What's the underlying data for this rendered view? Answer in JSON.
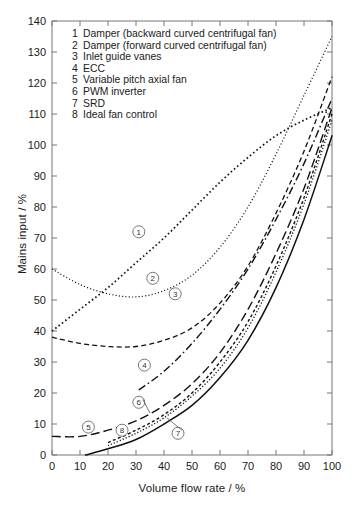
{
  "chart_data": {
    "type": "line",
    "title": "",
    "xlabel": "Volume flow rate / %",
    "ylabel": "Mains input / %",
    "xlim": [
      0,
      100
    ],
    "ylim": [
      0,
      140
    ],
    "xticks": [
      0,
      10,
      20,
      30,
      40,
      50,
      60,
      70,
      80,
      90,
      100
    ],
    "yticks": [
      0,
      10,
      20,
      30,
      40,
      50,
      60,
      70,
      80,
      90,
      100,
      110,
      120,
      130,
      140
    ],
    "grid": false,
    "legend_position": "upper-left-inside",
    "series": [
      {
        "id": "1",
        "name": "Damper (backward curved centrifugal fan)",
        "style": "dotted",
        "label_point": [
          31,
          72
        ],
        "x": [
          0,
          10,
          20,
          30,
          40,
          50,
          60,
          70,
          80,
          90,
          100
        ],
        "y": [
          40,
          47,
          54,
          62,
          70,
          79,
          88,
          96,
          103,
          108,
          112
        ]
      },
      {
        "id": "2",
        "name": "Damper (forward curved centrifugal fan)",
        "style": "fine-dotted",
        "label_point": [
          36,
          57
        ],
        "x": [
          0,
          10,
          20,
          30,
          40,
          50,
          60,
          70,
          80,
          90,
          100
        ],
        "y": [
          60,
          55,
          52,
          51,
          53,
          58,
          67,
          80,
          97,
          116,
          135
        ]
      },
      {
        "id": "3",
        "name": "Inlet guide vanes",
        "style": "dashed",
        "label_point": [
          44,
          52
        ],
        "x": [
          0,
          10,
          20,
          30,
          40,
          50,
          60,
          70,
          80,
          90,
          100
        ],
        "y": [
          38,
          36,
          35,
          35,
          37,
          41,
          49,
          61,
          78,
          98,
          122
        ]
      },
      {
        "id": "4",
        "name": "ECC",
        "style": "dash-dot",
        "label_point": [
          33,
          29
        ],
        "x": [
          31,
          40,
          50,
          60,
          70,
          80,
          90,
          100
        ],
        "y": [
          21,
          27,
          36,
          47,
          60,
          76,
          94,
          115
        ]
      },
      {
        "id": "5",
        "name": "Variable pitch axial fan",
        "style": "long-dashed",
        "label_point": [
          13,
          9
        ],
        "x": [
          0,
          10,
          20,
          30,
          40,
          50,
          60,
          70,
          80,
          90,
          100
        ],
        "y": [
          6,
          6,
          8,
          11,
          16,
          23,
          33,
          47,
          65,
          86,
          112
        ]
      },
      {
        "id": "6",
        "name": "PWM inverter",
        "style": "short-dashed",
        "label_point": [
          31,
          17
        ],
        "x": [
          20,
          30,
          40,
          50,
          60,
          70,
          80,
          90,
          100
        ],
        "y": [
          4,
          8,
          13,
          20,
          30,
          43,
          61,
          83,
          110
        ]
      },
      {
        "id": "7",
        "name": "SRD",
        "style": "dotted-fine",
        "label_point": [
          45,
          7
        ],
        "x": [
          20,
          30,
          40,
          50,
          60,
          70,
          80,
          90,
          100
        ],
        "y": [
          3,
          7,
          12,
          19,
          28,
          41,
          59,
          81,
          108
        ]
      },
      {
        "id": "8",
        "name": "Ideal fan control",
        "style": "solid",
        "label_point": [
          25,
          8
        ],
        "x": [
          12,
          20,
          30,
          40,
          50,
          60,
          70,
          80,
          90,
          100
        ],
        "y": [
          0,
          2,
          5,
          10,
          16,
          25,
          37,
          54,
          76,
          103
        ]
      }
    ]
  },
  "legend": {
    "entries": [
      {
        "num": "1",
        "text": "Damper (backward curved centrifugal fan)"
      },
      {
        "num": "2",
        "text": "Damper (forward curved centrifugal fan)"
      },
      {
        "num": "3",
        "text": "Inlet guide vanes"
      },
      {
        "num": "4",
        "text": "ECC"
      },
      {
        "num": "5",
        "text": "Variable pitch axial fan"
      },
      {
        "num": "6",
        "text": "PWM inverter"
      },
      {
        "num": "7",
        "text": "SRD"
      },
      {
        "num": "8",
        "text": "Ideal fan control"
      }
    ]
  }
}
